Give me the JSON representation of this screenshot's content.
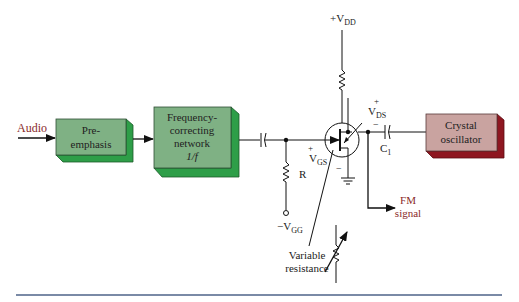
{
  "diagram": {
    "type": "block-circuit",
    "title_hint": "FET reactance-style FM modulator",
    "colors": {
      "green_face": "#7fb184",
      "green_side": "#2e9e48",
      "red_face": "#c9a3a0",
      "red_side": "#8e1620",
      "wire": "#111111",
      "signal_text": "#8a2a2a",
      "rule": "#7a8aa6"
    },
    "input_label": "Audio",
    "blocks": [
      {
        "id": "pre-emphasis",
        "lines": [
          "Pre-",
          "emphasis"
        ]
      },
      {
        "id": "frequency-correcting",
        "lines": [
          "Frequency-",
          "correcting",
          "network",
          "1/f"
        ]
      },
      {
        "id": "crystal-oscillator",
        "lines": [
          "Crystal",
          "oscillator"
        ]
      }
    ],
    "components": {
      "vdd": {
        "prefix": "+V",
        "sub": "DD"
      },
      "vds": {
        "plus": "+",
        "main": "V",
        "sub": "DS",
        "minus": "−"
      },
      "vgs": {
        "plus": "+",
        "main": "V",
        "sub": "GS",
        "minus": "−"
      },
      "vgg": {
        "prefix": "−V",
        "sub": "GG"
      },
      "resistor_r": "R",
      "capacitor_c1": {
        "main": "C",
        "sub": "1"
      }
    },
    "output_label": [
      "FM",
      "signal"
    ],
    "annotation": [
      "Variable",
      "resistance"
    ]
  }
}
